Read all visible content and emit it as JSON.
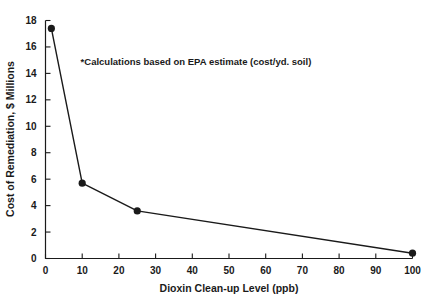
{
  "chart_data": {
    "type": "line",
    "title": "",
    "xlabel": "Dioxin Clean-up Level (ppb)",
    "ylabel": "Cost of Remediation, $ Millions",
    "xlim": [
      0,
      100
    ],
    "ylim": [
      0,
      18
    ],
    "grid": false,
    "legend": "none",
    "xticks": [
      0,
      10,
      20,
      30,
      40,
      50,
      60,
      70,
      80,
      90,
      100
    ],
    "xtick_labels": [
      "0",
      "10",
      "20",
      "30",
      "40",
      "50",
      "60",
      "70",
      "80",
      "90",
      "100"
    ],
    "yticks": [
      0,
      2,
      4,
      6,
      8,
      10,
      12,
      14,
      16,
      18
    ],
    "ytick_labels": [
      "0",
      "2",
      "4",
      "6",
      "8",
      "10",
      "12",
      "14",
      "16",
      "18"
    ],
    "series": [
      {
        "name": "Cost of Remediation",
        "marker": "filled-circle",
        "x": [
          1.6,
          10,
          25,
          100
        ],
        "y": [
          17.4,
          5.7,
          3.6,
          0.4
        ]
      }
    ],
    "annotations": [
      {
        "text": "*Calculations based on EPA estimate (cost/yd. soil)",
        "x": 41,
        "y": 14.6
      }
    ]
  }
}
